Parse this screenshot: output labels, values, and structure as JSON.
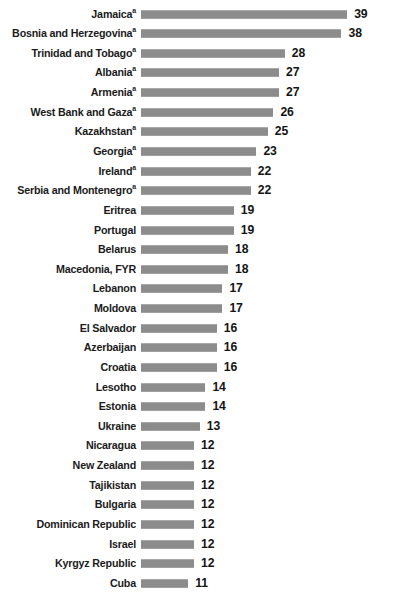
{
  "chart_data": {
    "type": "bar",
    "orientation": "horizontal",
    "title": "",
    "subtitle": "",
    "xlabel": "",
    "ylabel": "",
    "grid": false,
    "legend": null,
    "axis_visible": false,
    "value_labels_shown": true,
    "xlim": [
      0,
      39
    ],
    "sort": "descending",
    "footnote_marker": "a",
    "bar_color": "#8c8c8c",
    "label_color": "#1b1b1b",
    "value_color": "#141414",
    "background": "#ffffff",
    "categories": [
      "Jamaica",
      "Bosnia and Herzegovina",
      "Trinidad and Tobago",
      "Albania",
      "Armenia",
      "West Bank and Gaza",
      "Kazakhstan",
      "Georgia",
      "Ireland",
      "Serbia and Montenegro",
      "Eritrea",
      "Portugal",
      "Belarus",
      "Macedonia, FYR",
      "Lebanon",
      "Moldova",
      "El Salvador",
      "Azerbaijan",
      "Croatia",
      "Lesotho",
      "Estonia",
      "Ukraine",
      "Nicaragua",
      "New Zealand",
      "Tajikistan",
      "Bulgaria",
      "Dominican Republic",
      "Israel",
      "Kyrgyz Republic",
      "Cuba"
    ],
    "values": [
      39,
      38,
      28,
      27,
      27,
      26,
      25,
      23,
      22,
      22,
      19,
      19,
      18,
      18,
      17,
      17,
      16,
      16,
      16,
      14,
      14,
      13,
      12,
      12,
      12,
      12,
      12,
      12,
      12,
      11
    ],
    "marked": [
      true,
      true,
      true,
      true,
      true,
      true,
      true,
      true,
      true,
      true,
      false,
      false,
      false,
      false,
      false,
      false,
      false,
      false,
      false,
      false,
      false,
      false,
      false,
      false,
      false,
      false,
      false,
      false,
      false,
      false
    ]
  },
  "rows": [
    {
      "label": "Jamaica",
      "value": "39",
      "marker": "a"
    },
    {
      "label": "Bosnia and Herzegovina",
      "value": "38",
      "marker": "a"
    },
    {
      "label": "Trinidad and Tobago",
      "value": "28",
      "marker": "a"
    },
    {
      "label": "Albania",
      "value": "27",
      "marker": "a"
    },
    {
      "label": "Armenia",
      "value": "27",
      "marker": "a"
    },
    {
      "label": "West Bank and Gaza",
      "value": "26",
      "marker": "a"
    },
    {
      "label": "Kazakhstan",
      "value": "25",
      "marker": "a"
    },
    {
      "label": "Georgia",
      "value": "23",
      "marker": "a"
    },
    {
      "label": "Ireland",
      "value": "22",
      "marker": "a"
    },
    {
      "label": "Serbia and Montenegro",
      "value": "22",
      "marker": "a"
    },
    {
      "label": "Eritrea",
      "value": "19",
      "marker": ""
    },
    {
      "label": "Portugal",
      "value": "19",
      "marker": ""
    },
    {
      "label": "Belarus",
      "value": "18",
      "marker": ""
    },
    {
      "label": "Macedonia, FYR",
      "value": "18",
      "marker": ""
    },
    {
      "label": "Lebanon",
      "value": "17",
      "marker": ""
    },
    {
      "label": "Moldova",
      "value": "17",
      "marker": ""
    },
    {
      "label": "El Salvador",
      "value": "16",
      "marker": ""
    },
    {
      "label": "Azerbaijan",
      "value": "16",
      "marker": ""
    },
    {
      "label": "Croatia",
      "value": "16",
      "marker": ""
    },
    {
      "label": "Lesotho",
      "value": "14",
      "marker": ""
    },
    {
      "label": "Estonia",
      "value": "14",
      "marker": ""
    },
    {
      "label": "Ukraine",
      "value": "13",
      "marker": ""
    },
    {
      "label": "Nicaragua",
      "value": "12",
      "marker": ""
    },
    {
      "label": "New Zealand",
      "value": "12",
      "marker": ""
    },
    {
      "label": "Tajikistan",
      "value": "12",
      "marker": ""
    },
    {
      "label": "Bulgaria",
      "value": "12",
      "marker": ""
    },
    {
      "label": "Dominican Republic",
      "value": "12",
      "marker": ""
    },
    {
      "label": "Israel",
      "value": "12",
      "marker": ""
    },
    {
      "label": "Kyrgyz Republic",
      "value": "12",
      "marker": ""
    },
    {
      "label": "Cuba",
      "value": "11",
      "marker": ""
    }
  ]
}
